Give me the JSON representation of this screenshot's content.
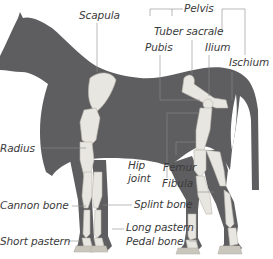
{
  "diagram": {
    "colors": {
      "body": "#5e5e60",
      "bone": "#e8e6e0",
      "bone_shade": "#c9c6be",
      "leader": "#8a8a8a",
      "text": "#3a3a3a",
      "background": "#ffffff"
    },
    "labels": {
      "scapula": "Scapula",
      "pelvis": "Pelvis",
      "tuber_sacrale": "Tuber sacrale",
      "pubis": "Pubis",
      "ilium": "Ilium",
      "ischium": "Ischium",
      "radius": "Radius",
      "hip_joint_line1": "Hip",
      "hip_joint_line2": "joint",
      "femur": "Femur",
      "fibula": "Fibula",
      "cannon_bone": "Cannon bone",
      "splint_bone": "Splint bone",
      "long_pastern": "Long pastern",
      "pedal_bone": "Pedal bone",
      "short_pastern": "Short pastern"
    }
  }
}
